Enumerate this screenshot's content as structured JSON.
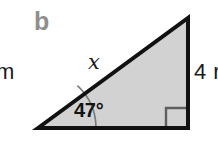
{
  "figure": {
    "part_label": "b",
    "shape": "right-triangle",
    "background_color": "#ffffff",
    "fill_color": "#d2d2d2",
    "edge_color": "#111111",
    "edge_width": 4,
    "marker_color": "#6e6e6e",
    "part_label_color": "#8e8e8e",
    "text_color": "#1a1a1a"
  },
  "labels": {
    "hypotenuse": "x",
    "angle": "47°",
    "right_side": "4 r",
    "left_clipped": "m"
  },
  "geometry": {
    "vertex_left": {
      "x": 38,
      "y": 128
    },
    "vertex_apex": {
      "x": 188,
      "y": 18
    },
    "vertex_right": {
      "x": 188,
      "y": 128
    },
    "angle_degrees": 47,
    "right_angle_vertex": "bottom-right",
    "right_angle_marker_size": 20,
    "angle_arc_radius": 58
  }
}
